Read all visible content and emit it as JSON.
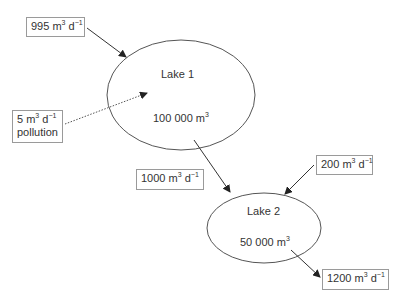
{
  "lakes": [
    {
      "name": "Lake 1",
      "volume": "100 000 m",
      "volume_exp": "3"
    },
    {
      "name": "Lake 2",
      "volume": "50 000 m",
      "volume_exp": "3"
    }
  ],
  "flows": {
    "inflow_lake1": {
      "value": "995 m",
      "exp1": "3",
      "mid": " d",
      "exp2": "−1"
    },
    "pollution": {
      "value": "5 m",
      "exp1": "3",
      "mid": " d",
      "exp2": "−1",
      "label": "pollution"
    },
    "lake1_to_lake2": {
      "value": "1000 m",
      "exp1": "3",
      "mid": " d",
      "exp2": "−1"
    },
    "inflow_lake2": {
      "value": "200 m",
      "exp1": "3",
      "mid": " d",
      "exp2": "−1"
    },
    "outflow_lake2": {
      "value": "1200 m",
      "exp1": "3",
      "mid": " d",
      "exp2": "−1"
    }
  }
}
